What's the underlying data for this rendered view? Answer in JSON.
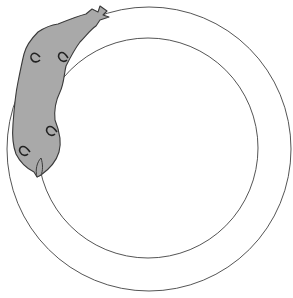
{
  "figure": {
    "colors": {
      "background": "#ffffff",
      "ring_stroke": "#555555",
      "creature_fill": "#a9a9a9",
      "creature_stroke": "#3a3a3a"
    },
    "outer_circle": {
      "cx": 149,
      "cy": 149,
      "r": 142
    },
    "inner_circle": {
      "cx": 148,
      "cy": 148,
      "r": 110
    }
  }
}
